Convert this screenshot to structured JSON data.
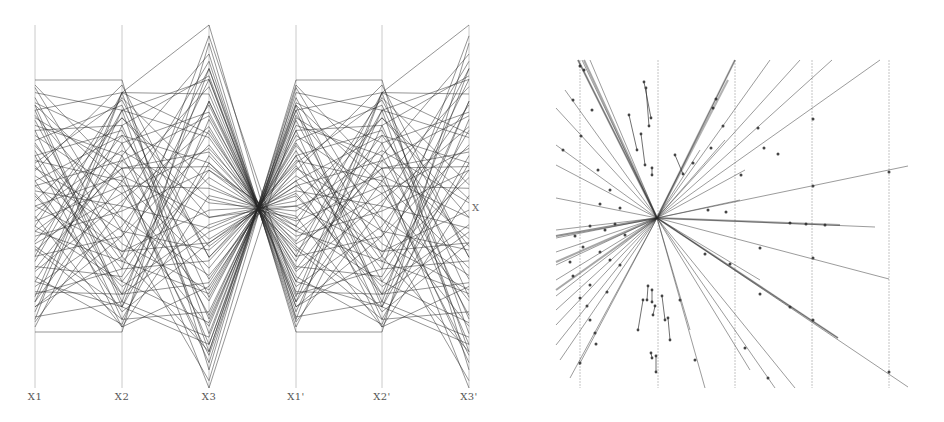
{
  "chart_data": [
    {
      "type": "parallel-coordinates",
      "title": "",
      "axes": [
        "X1",
        "X2",
        "X3",
        "X1'",
        "X2'",
        "X3'"
      ],
      "side_label": "X",
      "axis_ranges_px": {
        "X1": [
          80,
          332
        ],
        "X2": [
          80,
          332
        ],
        "X3": [
          25,
          388
        ],
        "X1'": [
          80,
          332
        ],
        "X2'": [
          80,
          332
        ],
        "X3'": [
          25,
          388
        ]
      },
      "note": "Records normalized 0-1 per axis; primed axes duplicate X1, X2, X3",
      "records": [
        [
          1.0,
          1.0,
          0.05
        ],
        [
          0.98,
          0.62,
          0.07
        ],
        [
          0.95,
          0.88,
          0.1
        ],
        [
          0.93,
          0.3,
          0.1
        ],
        [
          0.91,
          0.75,
          0.12
        ],
        [
          0.9,
          0.12,
          0.14
        ],
        [
          0.88,
          0.95,
          0.15
        ],
        [
          0.86,
          0.45,
          0.17
        ],
        [
          0.84,
          0.2,
          0.18
        ],
        [
          0.82,
          0.7,
          0.2
        ],
        [
          0.8,
          0.05,
          0.21
        ],
        [
          0.78,
          0.55,
          0.24
        ],
        [
          0.76,
          0.9,
          0.25
        ],
        [
          0.74,
          0.35,
          0.27
        ],
        [
          0.72,
          0.15,
          0.29
        ],
        [
          0.7,
          0.8,
          0.3
        ],
        [
          0.68,
          0.6,
          0.33
        ],
        [
          0.66,
          0.25,
          0.35
        ],
        [
          0.64,
          0.98,
          0.36
        ],
        [
          0.62,
          0.4,
          0.38
        ],
        [
          0.6,
          0.08,
          0.4
        ],
        [
          0.58,
          0.68,
          0.41
        ],
        [
          0.56,
          0.5,
          0.44
        ],
        [
          0.54,
          0.18,
          0.45
        ],
        [
          0.52,
          0.85,
          0.47
        ],
        [
          0.5,
          0.32,
          0.49
        ],
        [
          0.48,
          0.72,
          0.51
        ],
        [
          0.46,
          0.02,
          0.53
        ],
        [
          0.44,
          0.58,
          0.55
        ],
        [
          0.42,
          0.93,
          0.56
        ],
        [
          0.4,
          0.28,
          0.58
        ],
        [
          0.38,
          0.48,
          0.6
        ],
        [
          0.36,
          0.78,
          0.62
        ],
        [
          0.34,
          0.1,
          0.64
        ],
        [
          0.32,
          0.65,
          0.65
        ],
        [
          0.3,
          0.38,
          0.67
        ],
        [
          0.28,
          0.88,
          0.69
        ],
        [
          0.26,
          0.22,
          0.71
        ],
        [
          0.24,
          0.52,
          0.72
        ],
        [
          0.22,
          0.03,
          0.74
        ],
        [
          0.2,
          0.75,
          0.76
        ],
        [
          0.18,
          0.42,
          0.78
        ],
        [
          0.16,
          0.15,
          0.79
        ],
        [
          0.14,
          0.95,
          0.81
        ],
        [
          0.12,
          0.6,
          0.83
        ],
        [
          0.1,
          0.3,
          0.85
        ],
        [
          0.08,
          0.82,
          0.86
        ],
        [
          0.06,
          0.12,
          0.88
        ],
        [
          0.04,
          0.5,
          0.9
        ],
        [
          0.02,
          0.7,
          0.92
        ],
        [
          0.0,
          0.0,
          0.95
        ],
        [
          0.97,
          0.4,
          0.02
        ],
        [
          0.05,
          0.95,
          1.0
        ],
        [
          0.15,
          0.25,
          0.97
        ],
        [
          0.85,
          0.65,
          0.0
        ],
        [
          0.35,
          0.55,
          0.66
        ],
        [
          0.65,
          0.45,
          0.31
        ],
        [
          0.45,
          0.85,
          0.52
        ],
        [
          0.55,
          0.15,
          0.43
        ],
        [
          0.25,
          0.68,
          0.75
        ],
        [
          0.75,
          0.28,
          0.26
        ],
        [
          0.1,
          0.38,
          0.88
        ],
        [
          0.9,
          0.58,
          0.09
        ],
        [
          0.33,
          0.05,
          0.62
        ],
        [
          0.67,
          0.92,
          0.36
        ],
        [
          0.5,
          0.62,
          0.47
        ],
        [
          0.2,
          0.1,
          0.79
        ],
        [
          0.8,
          0.82,
          0.19
        ],
        [
          0.58,
          0.32,
          0.4
        ],
        [
          0.42,
          0.2,
          0.6
        ],
        [
          0.12,
          0.88,
          0.85
        ],
        [
          0.88,
          0.1,
          0.12
        ],
        [
          0.3,
          0.95,
          0.7
        ],
        [
          0.7,
          0.02,
          0.28
        ],
        [
          0.6,
          0.78,
          0.39
        ],
        [
          0.4,
          0.65,
          0.61
        ]
      ]
    },
    {
      "type": "line",
      "title": "",
      "center_px": [
        657,
        218
      ],
      "gridlines_x_px": [
        580,
        658,
        735,
        812,
        889
      ],
      "grid_y_range_px": [
        60,
        388
      ],
      "rays": [
        {
          "l": [
            578,
            60
          ],
          "r": null,
          "m": [
            [
              580,
              66
            ],
            [
              592,
              110
            ]
          ]
        },
        {
          "l": [
            582,
            60
          ],
          "r": null,
          "m": [
            [
              584,
              70
            ]
          ]
        },
        {
          "l": [
            590,
            60
          ],
          "r": null,
          "m": []
        },
        {
          "l": [
            565,
            90
          ],
          "r": null,
          "m": [
            [
              573,
              100
            ]
          ]
        },
        {
          "l": [
            556,
            108
          ],
          "r": null,
          "m": [
            [
              581,
              136
            ]
          ]
        },
        {
          "l": [
            556,
            145
          ],
          "r": null,
          "m": [
            [
              563,
              150
            ],
            [
              598,
              170
            ]
          ]
        },
        {
          "l": [
            556,
            165
          ],
          "r": null,
          "m": [
            [
              610,
              190
            ]
          ]
        },
        {
          "l": [
            556,
            198
          ],
          "r": null,
          "m": [
            [
              600,
              204
            ],
            [
              620,
              208
            ]
          ]
        },
        {
          "l": [
            556,
            230
          ],
          "r": null,
          "m": [
            [
              590,
              226
            ],
            [
              615,
              224
            ]
          ]
        },
        {
          "l": [
            556,
            238
          ],
          "r": null,
          "m": [
            [
              575,
              236
            ],
            [
              605,
              230
            ]
          ]
        },
        {
          "l": [
            556,
            252
          ],
          "r": null,
          "m": [
            [
              583,
              247
            ],
            [
              625,
              235
            ]
          ]
        },
        {
          "l": [
            556,
            265
          ],
          "r": null,
          "m": [
            [
              570,
              262
            ],
            [
              600,
              252
            ]
          ]
        },
        {
          "l": [
            556,
            280
          ],
          "r": null,
          "m": [
            [
              573,
              276
            ],
            [
              610,
              260
            ]
          ]
        },
        {
          "l": [
            556,
            296
          ],
          "r": null,
          "m": [
            [
              590,
              285
            ],
            [
              620,
              265
            ]
          ]
        },
        {
          "l": [
            556,
            310
          ],
          "r": null,
          "m": [
            [
              580,
              298
            ]
          ]
        },
        {
          "l": [
            556,
            325
          ],
          "r": null,
          "m": [
            [
              587,
              306
            ],
            [
              607,
              292
            ]
          ]
        },
        {
          "l": [
            556,
            345
          ],
          "r": null,
          "m": [
            [
              590,
              320
            ]
          ]
        },
        {
          "l": [
            560,
            360
          ],
          "r": null,
          "m": [
            [
              595,
              333
            ]
          ]
        },
        {
          "l": [
            579,
            365
          ],
          "r": null,
          "m": [
            [
              580,
              363
            ],
            [
              596,
              344
            ]
          ]
        },
        {
          "l": [
            570,
            378
          ],
          "r": null,
          "m": []
        },
        {
          "l": null,
          "r": [
            735,
            60
          ],
          "m": [
            [
              716,
              99
            ],
            [
              713,
              108
            ]
          ]
        },
        {
          "l": null,
          "r": [
            770,
            60
          ],
          "m": [
            [
              723,
              126
            ]
          ]
        },
        {
          "l": null,
          "r": [
            800,
            60
          ],
          "m": [
            [
              758,
              128
            ]
          ]
        },
        {
          "l": null,
          "r": [
            832,
            60
          ],
          "m": [
            [
              764,
              148
            ]
          ]
        },
        {
          "l": null,
          "r": [
            880,
            60
          ],
          "m": [
            [
              778,
              154
            ],
            [
              813,
              119
            ]
          ]
        },
        {
          "l": null,
          "r": [
            908,
            166
          ],
          "m": [
            [
              813,
              186
            ],
            [
              889,
              172
            ]
          ]
        },
        {
          "l": null,
          "r": [
            875,
            227
          ],
          "m": [
            [
              825,
              225
            ],
            [
              806,
              224
            ],
            [
              790,
              223
            ]
          ]
        },
        {
          "l": null,
          "r": [
            889,
            279
          ],
          "m": [
            [
              813,
              258
            ],
            [
              760,
              248
            ]
          ]
        },
        {
          "l": null,
          "r": [
            838,
            338
          ],
          "m": [
            [
              790,
              307
            ],
            [
              760,
              294
            ]
          ]
        },
        {
          "l": null,
          "r": [
            908,
            387
          ],
          "m": [
            [
              889,
              372
            ],
            [
              813,
              320
            ]
          ]
        },
        {
          "l": null,
          "r": [
            750,
            370
          ],
          "m": [
            [
              745,
              348
            ]
          ]
        },
        {
          "l": null,
          "r": [
            775,
            388
          ],
          "m": [
            [
              768,
              378
            ]
          ]
        },
        {
          "l": null,
          "r": [
            795,
            388
          ],
          "m": []
        },
        {
          "l": null,
          "r": [
            705,
            388
          ],
          "m": [
            [
              695,
              360
            ]
          ]
        },
        {
          "l": null,
          "r": [
            690,
            330
          ],
          "m": [
            [
              680,
              300
            ]
          ]
        },
        {
          "l": null,
          "r": [
            760,
            280
          ],
          "m": [
            [
              705,
              254
            ],
            [
              730,
              264
            ]
          ]
        },
        {
          "l": null,
          "r": [
            700,
            150
          ],
          "m": [
            [
              693,
              163
            ]
          ]
        },
        {
          "l": null,
          "r": [
            745,
            170
          ],
          "m": [
            [
              741,
              175
            ]
          ]
        },
        {
          "l": null,
          "r": [
            725,
            140
          ],
          "m": [
            [
              711,
              148
            ]
          ]
        },
        {
          "l": null,
          "r": [
            740,
            200
          ],
          "m": [
            [
              726,
              212
            ],
            [
              708,
              210
            ]
          ]
        }
      ],
      "segments": [
        [
          644,
          82,
          651,
          118
        ],
        [
          646,
          88,
          649,
          126
        ],
        [
          629,
          115,
          637,
          150
        ],
        [
          641,
          134,
          645,
          165
        ],
        [
          652,
          168,
          652,
          175
        ],
        [
          675,
          155,
          683,
          174
        ],
        [
          638,
          330,
          643,
          300
        ],
        [
          652,
          290,
          652,
          302
        ],
        [
          655,
          306,
          653,
          315
        ],
        [
          662,
          296,
          665,
          320
        ],
        [
          651,
          353,
          652,
          358
        ],
        [
          668,
          318,
          670,
          340
        ],
        [
          656,
          356,
          656,
          372
        ],
        [
          648,
          286,
          647,
          300
        ]
      ]
    }
  ]
}
